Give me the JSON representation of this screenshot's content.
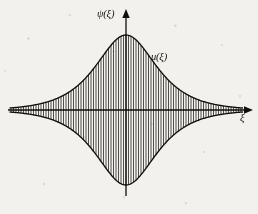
{
  "figure": {
    "kind": "line-plot",
    "background_color": "#f2f1ee",
    "ink_color": "#16150f"
  },
  "labels": {
    "y_axis": "ψ(ξ)",
    "envelope": "u(ξ)",
    "x_axis": "ξ"
  },
  "icons": {
    "x_axis_arrow": "arrow-right-icon",
    "y_axis_arrow": "arrow-up-icon"
  },
  "chart_data": {
    "type": "line",
    "title": "",
    "xlabel": "ξ",
    "ylabel": "ψ(ξ)",
    "legend": [
      "u(ξ)"
    ],
    "legend_position": "inline-upper-right",
    "grid": false,
    "axes": {
      "x_axis_y_px": 110,
      "y_axis_x_px": 126,
      "x_range_px": [
        8,
        248
      ],
      "y_range_px": [
        12,
        196
      ],
      "origin_px": [
        126,
        110
      ],
      "x_arrow": true,
      "y_arrow": true,
      "ticks": [],
      "tick_labels": []
    },
    "envelope": {
      "form": "A*sech(xi/L)",
      "amplitude_px": 75,
      "width_scale_px": 27,
      "peak_top_px": 35,
      "peak_bottom_px": 185,
      "symmetric_about_x_axis": true,
      "x_start_px": 10,
      "x_end_px": 243
    },
    "carrier": {
      "form": "cos(k*xi)",
      "render": "vertical-hatch-lines",
      "line_spacing_px": 2.5,
      "line_count": 93,
      "line_width_px": 0.75
    },
    "x": [
      -115,
      -100,
      -85,
      -70,
      -55,
      -45,
      -35,
      -28,
      -21,
      -14,
      -7,
      0,
      7,
      14,
      21,
      28,
      35,
      45,
      55,
      70,
      85,
      100,
      115
    ],
    "envelope_values": [
      0.0,
      0.1,
      0.3,
      1.1,
      3.2,
      6.5,
      12.8,
      21.5,
      34.9,
      53.5,
      75.8,
      100.0,
      75.8,
      53.5,
      34.9,
      21.5,
      12.8,
      6.5,
      3.2,
      1.1,
      0.3,
      0.1,
      0.0
    ],
    "ylim": [
      -100,
      100
    ],
    "xlim": [
      -120,
      120
    ],
    "value_units": "percent of peak amplitude"
  }
}
